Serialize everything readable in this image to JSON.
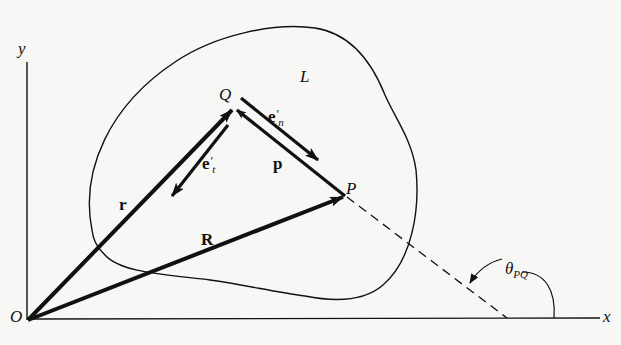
{
  "diagram": {
    "type": "vector-geometry",
    "labels": {
      "y_axis": "y",
      "x_axis": "x",
      "origin": "O",
      "region": "L",
      "point_Q": "Q",
      "point_P": "P",
      "vec_r": "r",
      "vec_R": "R",
      "vec_p": "p",
      "vec_en_base": "e",
      "vec_en_prime": "′",
      "vec_en_sub": "n",
      "vec_et_base": "e",
      "vec_et_prime": "′",
      "vec_et_sub": "t",
      "angle_base": "θ",
      "angle_sub": "PQ"
    },
    "points": {
      "O": [
        28,
        320
      ],
      "Q": [
        234,
        108
      ],
      "P": [
        345,
        196
      ],
      "dashed_end": [
        507,
        318
      ]
    },
    "colors": {
      "ink": "#111111",
      "background": "#f7f7f5"
    }
  }
}
